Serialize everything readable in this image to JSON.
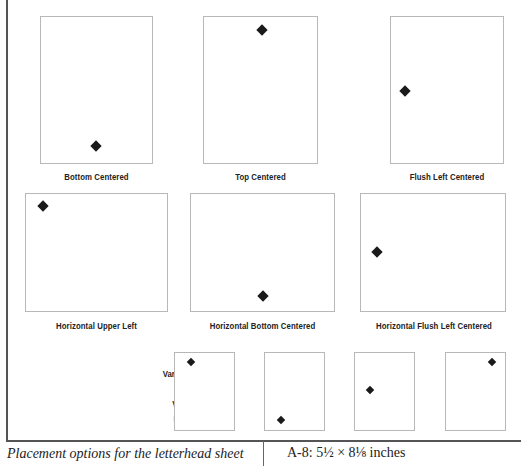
{
  "figure": {
    "id": "A-8",
    "title": "A-8: 5½ × 8⅛ inches",
    "caption": "Placement options for the letterhead sheet",
    "variations_label": [
      "Variations",
      "on",
      "Vertical",
      "Format"
    ]
  },
  "layouts": [
    {
      "label": "Bottom Centered",
      "orientation": "vertical",
      "mark": "diamond-icon"
    },
    {
      "label": "Top Centered",
      "orientation": "vertical",
      "mark": "diamond-icon"
    },
    {
      "label": "Flush Left Centered",
      "orientation": "vertical",
      "mark": "diamond-icon"
    },
    {
      "label": "Horizontal Upper Left",
      "orientation": "horizontal",
      "mark": "diamond-icon"
    },
    {
      "label": "Horizontal Bottom Centered",
      "orientation": "horizontal",
      "mark": "diamond-icon"
    },
    {
      "label": "Horizontal Flush Left Centered",
      "orientation": "horizontal",
      "mark": "diamond-icon"
    }
  ],
  "variations": [
    {
      "position": "upper-left"
    },
    {
      "position": "bottom-left"
    },
    {
      "position": "middle-left"
    },
    {
      "position": "upper-right"
    }
  ],
  "colors": {
    "mark": "#1a1a1a",
    "sheet_border": "#b8b8b8",
    "rule": "#555555"
  }
}
